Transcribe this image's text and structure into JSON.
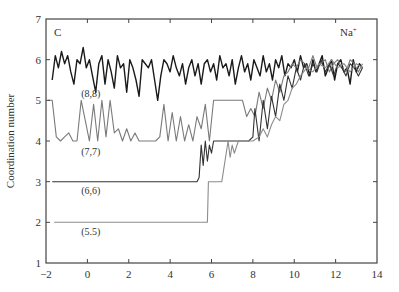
{
  "chart_data": {
    "type": "line",
    "title": "",
    "panel_label": "C",
    "ion_label": "Na",
    "ion_charge": "+",
    "xlabel": "",
    "ylabel": "Coordination number",
    "xlim": [
      -2,
      14
    ],
    "ylim": [
      1,
      7
    ],
    "xticks": [
      -2,
      0,
      2,
      4,
      6,
      8,
      10,
      12,
      14
    ],
    "yticks": [
      1,
      2,
      3,
      4,
      5,
      6,
      7
    ],
    "grid": false,
    "legend": "inline annotations",
    "series": [
      {
        "name": "(8,8)",
        "color": "#1a1a1a",
        "label_pos": [
          -0.3,
          5.08
        ],
        "x": [
          -1.7,
          -1.55,
          -1.4,
          -1.25,
          -1.1,
          -0.95,
          -0.8,
          -0.65,
          -0.5,
          -0.35,
          -0.2,
          -0.05,
          0.1,
          0.25,
          0.4,
          0.55,
          0.7,
          0.85,
          1.0,
          1.15,
          1.3,
          1.45,
          1.6,
          1.75,
          1.9,
          2.05,
          2.2,
          2.35,
          2.5,
          2.65,
          2.8,
          2.95,
          3.1,
          3.25,
          3.4,
          3.55,
          3.7,
          3.85,
          4.0,
          4.15,
          4.3,
          4.45,
          4.6,
          4.75,
          4.9,
          5.05,
          5.2,
          5.35,
          5.5,
          5.65,
          5.8,
          5.95,
          6.1,
          6.25,
          6.4,
          6.55,
          6.7,
          6.85,
          7.0,
          7.15,
          7.3,
          7.45,
          7.6,
          7.75,
          7.9,
          8.05,
          8.2,
          8.35,
          8.5,
          8.65,
          8.8,
          8.95,
          9.1,
          9.25,
          9.4,
          9.55,
          9.7,
          9.85,
          10.0,
          10.15,
          10.3,
          10.45,
          10.6,
          10.75,
          10.9,
          11.05,
          11.2,
          11.35,
          11.5,
          11.65,
          11.8,
          11.95,
          12.1,
          12.25,
          12.4,
          12.55,
          12.7,
          12.85,
          13.0,
          13.15,
          13.3
        ],
        "y": [
          5.5,
          6.1,
          5.8,
          6.2,
          5.9,
          6.1,
          5.7,
          5.4,
          6.0,
          5.9,
          6.3,
          5.8,
          6.0,
          5.6,
          5.2,
          5.9,
          6.1,
          5.4,
          6.0,
          5.7,
          5.3,
          6.1,
          5.8,
          5.9,
          5.2,
          6.0,
          5.8,
          5.5,
          5.1,
          6.0,
          5.9,
          5.8,
          6.0,
          5.5,
          5.0,
          5.6,
          6.0,
          5.9,
          5.7,
          6.1,
          5.8,
          5.6,
          5.9,
          5.4,
          5.8,
          6.0,
          5.6,
          5.9,
          5.4,
          5.9,
          6.0,
          5.7,
          5.9,
          5.5,
          6.1,
          5.8,
          5.9,
          5.6,
          6.0,
          5.4,
          5.8,
          6.1,
          5.7,
          5.9,
          5.5,
          6.0,
          5.8,
          5.6,
          6.1,
          5.7,
          5.9,
          5.5,
          6.0,
          5.8,
          6.1,
          5.6,
          5.9,
          5.8,
          6.0,
          5.7,
          6.1,
          5.8,
          5.9,
          5.6,
          6.0,
          5.7,
          5.9,
          6.1,
          5.6,
          5.8,
          6.0,
          5.5,
          5.9,
          6.0,
          5.7,
          5.8,
          5.4,
          6.0,
          5.7,
          5.9,
          5.8
        ]
      },
      {
        "name": "(7,7)",
        "color": "#7a7a7a",
        "label_pos": [
          -0.3,
          3.65
        ],
        "x": [
          -1.9,
          -1.7,
          -1.5,
          -1.3,
          -1.1,
          -0.9,
          -0.7,
          -0.5,
          -0.3,
          -0.1,
          0.1,
          0.3,
          0.5,
          0.7,
          0.9,
          1.1,
          1.3,
          1.5,
          1.7,
          1.9,
          2.1,
          2.3,
          2.5,
          2.7,
          2.9,
          3.1,
          3.3,
          3.5,
          3.7,
          3.9,
          4.1,
          4.3,
          4.5,
          4.7,
          4.9,
          5.1,
          5.3,
          5.5,
          5.7,
          5.9,
          6.1,
          6.3,
          6.6,
          6.9,
          7.2,
          7.5,
          7.7,
          7.9,
          8.1,
          8.3,
          8.5,
          8.7,
          8.9,
          9.1,
          9.3,
          9.5,
          9.7,
          9.9,
          10.1,
          10.3,
          10.5,
          10.7,
          10.9,
          11.1,
          11.3,
          11.5,
          11.7,
          11.9,
          12.1,
          12.3,
          12.5,
          12.7,
          12.9,
          13.1,
          13.3
        ],
        "y": [
          5.0,
          5.0,
          4.1,
          4.0,
          4.1,
          4.2,
          4.0,
          4.0,
          5.0,
          4.5,
          4.0,
          4.9,
          4.0,
          5.0,
          4.1,
          5.0,
          4.2,
          4.3,
          4.0,
          4.3,
          4.0,
          4.2,
          4.0,
          4.0,
          4.0,
          4.0,
          4.0,
          4.1,
          4.9,
          4.0,
          4.7,
          4.0,
          4.6,
          4.0,
          4.4,
          4.0,
          4.6,
          4.3,
          4.9,
          4.0,
          5.0,
          5.0,
          5.0,
          5.0,
          5.0,
          5.0,
          4.6,
          4.8,
          4.6,
          5.2,
          4.8,
          5.3,
          5.0,
          5.5,
          5.2,
          5.6,
          5.7,
          5.9,
          5.8,
          6.0,
          5.9,
          5.8,
          6.1,
          5.8,
          5.9,
          6.0,
          5.7,
          5.9,
          6.0,
          5.8,
          5.7,
          6.0,
          5.9,
          5.7,
          5.9
        ]
      },
      {
        "name": "(6,6)",
        "color": "#333333",
        "label_pos": [
          -0.3,
          2.7
        ],
        "x": [
          -1.7,
          5.3,
          5.4,
          5.5,
          5.6,
          5.7,
          5.8,
          5.9,
          6.0,
          6.1,
          6.3,
          7.0,
          7.8,
          8.0,
          8.1,
          8.3,
          8.5,
          8.7,
          8.9,
          9.1,
          9.3,
          9.5,
          9.7,
          9.9,
          10.1,
          10.3,
          10.5,
          10.7,
          10.9,
          11.1,
          11.3,
          11.5,
          11.7,
          11.9,
          12.1,
          12.3,
          12.5,
          12.7,
          12.9,
          13.1,
          13.3
        ],
        "y": [
          3.0,
          3.0,
          3.1,
          3.9,
          3.4,
          4.0,
          3.5,
          3.9,
          3.7,
          4.0,
          4.0,
          4.0,
          4.0,
          4.1,
          4.8,
          4.0,
          5.0,
          4.3,
          5.1,
          4.6,
          5.4,
          5.0,
          5.6,
          5.3,
          5.8,
          5.5,
          5.9,
          5.6,
          5.9,
          5.7,
          6.0,
          5.7,
          5.9,
          5.6,
          5.9,
          5.8,
          5.6,
          5.9,
          5.8,
          5.6,
          5.8
        ]
      },
      {
        "name": "(5.5)",
        "color": "#8c8c8c",
        "label_pos": [
          -0.3,
          1.68
        ],
        "x": [
          -1.6,
          5.8,
          5.85,
          6.4,
          6.5,
          6.8,
          6.9,
          7.0,
          7.1,
          7.3,
          7.6,
          8.0,
          8.3,
          8.5,
          8.7,
          8.9,
          9.1,
          9.3,
          9.5,
          9.7,
          9.9,
          10.1,
          10.3,
          10.6,
          10.9,
          11.2,
          11.5,
          11.8,
          12.1,
          12.4,
          12.7,
          13.0,
          13.3
        ],
        "y": [
          2.0,
          2.0,
          3.0,
          3.0,
          3.0,
          4.0,
          3.6,
          3.9,
          3.7,
          4.0,
          4.0,
          4.0,
          4.1,
          4.3,
          4.1,
          4.4,
          4.6,
          4.5,
          4.9,
          5.0,
          5.3,
          5.4,
          5.6,
          5.8,
          5.7,
          5.9,
          5.8,
          6.0,
          5.8,
          5.9,
          5.7,
          5.9,
          5.8
        ]
      }
    ]
  }
}
